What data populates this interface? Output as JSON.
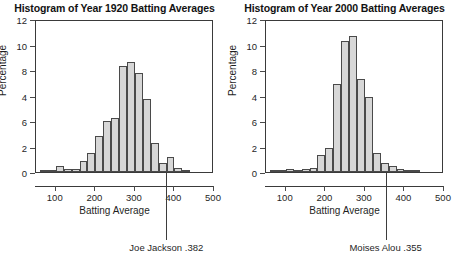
{
  "figure": {
    "width": 459,
    "height": 277,
    "background": "#ffffff",
    "bar_fill": "#d7d7d7",
    "bar_stroke": "#4a4a4a",
    "axis_color": "#3a3a3a"
  },
  "panels": [
    {
      "id": "panel-1920",
      "title": "Histogram of Year 1920 Batting Averages",
      "annotation": {
        "label": "Joe Jackson .382",
        "value": 382
      }
    },
    {
      "id": "panel-2000",
      "title": "Histogram of Year 2000 Batting Averages",
      "annotation": {
        "label": "Moises Alou .355",
        "value": 355
      }
    }
  ],
  "chart_data": [
    {
      "type": "bar",
      "title": "Histogram of Year 1920 Batting Averages",
      "xlabel": "Batting Average",
      "ylabel": "Percentage",
      "xlim": [
        50,
        500
      ],
      "ylim": [
        0,
        12
      ],
      "xticks": [
        100,
        200,
        300,
        400,
        500
      ],
      "ytick_labels": [
        "12",
        "10",
        "8",
        "4",
        "6",
        "2",
        "0"
      ],
      "ytick_values": [
        12,
        10,
        8,
        6,
        4,
        2,
        0
      ],
      "grid": false,
      "legend": null,
      "bin_width": 20,
      "bin_starts": [
        60,
        80,
        100,
        120,
        140,
        160,
        180,
        200,
        220,
        240,
        260,
        280,
        300,
        320,
        340,
        360,
        380,
        400,
        420
      ],
      "values": [
        0.1,
        0.1,
        0.45,
        0.2,
        0.2,
        0.85,
        1.5,
        2.85,
        4.0,
        4.25,
        8.35,
        8.6,
        7.75,
        5.7,
        2.25,
        0.7,
        1.15,
        0.3,
        0.05
      ],
      "annotation": {
        "label": "Joe Jackson .382",
        "x": 382
      }
    },
    {
      "type": "bar",
      "title": "Histogram of Year 2000 Batting Averages",
      "xlabel": "Batting Average",
      "ylabel": "Percentage",
      "xlim": [
        50,
        500
      ],
      "ylim": [
        0,
        12
      ],
      "xticks": [
        100,
        200,
        300,
        400,
        500
      ],
      "ytick_labels": [
        "12",
        "10",
        "8",
        "4",
        "6",
        "2",
        "0"
      ],
      "ytick_values": [
        12,
        10,
        8,
        6,
        4,
        2,
        0
      ],
      "grid": false,
      "legend": null,
      "bin_width": 20,
      "bin_starts": [
        60,
        80,
        100,
        120,
        140,
        160,
        180,
        200,
        220,
        240,
        260,
        280,
        300,
        320,
        340,
        360,
        380,
        400,
        420
      ],
      "values": [
        0.05,
        0.1,
        0.2,
        0.15,
        0.2,
        0.3,
        1.35,
        1.9,
        6.9,
        10.3,
        10.65,
        7.3,
        5.9,
        1.5,
        0.7,
        0.45,
        0.25,
        0.1,
        0.05
      ],
      "annotation": {
        "label": "Moises Alou .355",
        "x": 355
      }
    }
  ]
}
